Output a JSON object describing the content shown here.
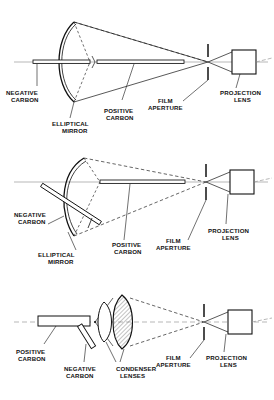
{
  "figure": {
    "type": "technical-line-diagram",
    "background_color": "#ffffff",
    "ink_color": "#111111",
    "panel_count": 3
  },
  "panels": [
    {
      "id": "panel-1",
      "name": "reflector-arc-inline-carbons",
      "description": "Elliptical mirror reflector arc lamp with horizontally aligned negative and positive carbons",
      "labels": [
        {
          "key": "negative_carbon",
          "line1": "NEGATIVE",
          "line2": "CARBON"
        },
        {
          "key": "elliptical_mirror",
          "line1": "ELLIPTICAL",
          "line2": "MIRROR"
        },
        {
          "key": "positive_carbon",
          "line1": "POSITIVE",
          "line2": "CARBON"
        },
        {
          "key": "film_aperture",
          "line1": "FILM",
          "line2": "APERTURE"
        },
        {
          "key": "projection_lens",
          "line1": "PROJECTION",
          "line2": "LENS"
        }
      ]
    },
    {
      "id": "panel-2",
      "name": "reflector-arc-angled-negative-carbon",
      "description": "Elliptical mirror reflector arc lamp with negative carbon angled downward at about 45 degrees",
      "labels": [
        {
          "key": "negative_carbon",
          "line1": "NEGATIVE",
          "line2": "CARBON"
        },
        {
          "key": "elliptical_mirror",
          "line1": "ELLIPTICAL",
          "line2": "MIRROR"
        },
        {
          "key": "positive_carbon",
          "line1": "POSITIVE",
          "line2": "CARBON"
        },
        {
          "key": "film_aperture",
          "line1": "FILM",
          "line2": "APERTURE"
        },
        {
          "key": "projection_lens",
          "line1": "PROJECTION",
          "line2": "LENS"
        }
      ]
    },
    {
      "id": "panel-3",
      "name": "condenser-lens-arc",
      "description": "Condenser lens arc lamp with positive carbon on axis and angled negative carbon, two condenser lenses",
      "labels": [
        {
          "key": "positive_carbon",
          "line1": "POSITIVE",
          "line2": "CARBON"
        },
        {
          "key": "negative_carbon",
          "line1": "NEGATIVE",
          "line2": "CARBON"
        },
        {
          "key": "condenser_lenses",
          "line1": "CONDENSER",
          "line2": "LENSES"
        },
        {
          "key": "film_aperture",
          "line1": "FILM",
          "line2": "APERTURE"
        },
        {
          "key": "projection_lens",
          "line1": "PROJECTION",
          "line2": "LENS"
        }
      ]
    }
  ]
}
